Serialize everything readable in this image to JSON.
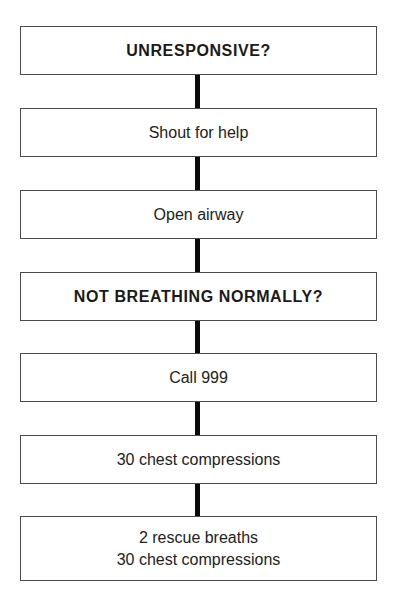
{
  "flowchart": {
    "steps": [
      {
        "label": "UNRESPONSIVE?",
        "emphasis": "bold"
      },
      {
        "label": "Shout for help",
        "emphasis": "normal"
      },
      {
        "label": "Open airway",
        "emphasis": "normal"
      },
      {
        "label": "NOT BREATHING NORMALLY?",
        "emphasis": "bold"
      },
      {
        "label": "Call 999",
        "emphasis": "normal"
      },
      {
        "label": "30 chest compressions",
        "emphasis": "normal"
      },
      {
        "label_lines": [
          "2 rescue breaths",
          "30 chest compressions"
        ],
        "emphasis": "normal"
      }
    ],
    "connector_color": "#0a0a0a",
    "box_border_color": "#4a4a4a"
  }
}
